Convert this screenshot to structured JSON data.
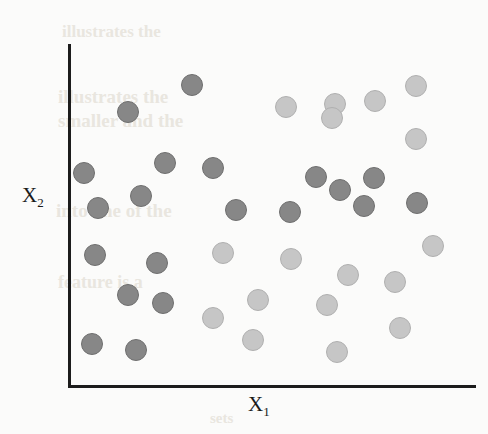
{
  "figure": {
    "width": 488,
    "height": 434,
    "background_color": "#fbfbfa"
  },
  "axes": {
    "x_label": "X",
    "x_label_sub": "1",
    "y_label": "X",
    "y_label_sub": "2",
    "line_color": "#1c1c1c"
  },
  "legend_colors": {
    "class_a": "#878787",
    "class_b": "#c6c6c6"
  },
  "bleed_text": [
    {
      "text": "illustrates the",
      "x": 62,
      "y": 22,
      "size": 17,
      "rotate": 0
    },
    {
      "text": "illustrates the",
      "x": 58,
      "y": 86,
      "size": 19,
      "rotate": 0
    },
    {
      "text": "smaller and the",
      "x": 58,
      "y": 110,
      "size": 19,
      "rotate": 0
    },
    {
      "text": "into one of the",
      "x": 56,
      "y": 200,
      "size": 19,
      "rotate": 0
    },
    {
      "text": "feature is a",
      "x": 58,
      "y": 272,
      "size": 18,
      "rotate": 0
    },
    {
      "text": "sets",
      "x": 210,
      "y": 410,
      "size": 15,
      "rotate": 0
    }
  ],
  "chart_data": {
    "type": "scatter",
    "title": "",
    "xlabel": "X1",
    "ylabel": "X2",
    "xlim": [
      0,
      1
    ],
    "ylim": [
      0,
      1
    ],
    "grid": false,
    "legend_position": "none",
    "point_radius_px": 11,
    "series": [
      {
        "name": "class-a",
        "color": "#878787",
        "marker": "circle",
        "points": [
          {
            "px": 192,
            "py": 85
          },
          {
            "px": 128,
            "py": 112
          },
          {
            "px": 165,
            "py": 163
          },
          {
            "px": 213,
            "py": 168
          },
          {
            "px": 84,
            "py": 173
          },
          {
            "px": 141,
            "py": 196
          },
          {
            "px": 98,
            "py": 208
          },
          {
            "px": 236,
            "py": 210
          },
          {
            "px": 290,
            "py": 212
          },
          {
            "px": 316,
            "py": 177
          },
          {
            "px": 340,
            "py": 190
          },
          {
            "px": 374,
            "py": 178
          },
          {
            "px": 364,
            "py": 206
          },
          {
            "px": 417,
            "py": 203
          },
          {
            "px": 95,
            "py": 255
          },
          {
            "px": 157,
            "py": 263
          },
          {
            "px": 128,
            "py": 295
          },
          {
            "px": 163,
            "py": 303
          },
          {
            "px": 92,
            "py": 344
          },
          {
            "px": 136,
            "py": 350
          }
        ]
      },
      {
        "name": "class-b",
        "color": "#c6c6c6",
        "marker": "circle",
        "points": [
          {
            "px": 335,
            "py": 104
          },
          {
            "px": 286,
            "py": 107
          },
          {
            "px": 332,
            "py": 118
          },
          {
            "px": 375,
            "py": 101
          },
          {
            "px": 416,
            "py": 86
          },
          {
            "px": 416,
            "py": 139
          },
          {
            "px": 433,
            "py": 246
          },
          {
            "px": 223,
            "py": 253
          },
          {
            "px": 291,
            "py": 259
          },
          {
            "px": 348,
            "py": 275
          },
          {
            "px": 395,
            "py": 282
          },
          {
            "px": 258,
            "py": 300
          },
          {
            "px": 327,
            "py": 305
          },
          {
            "px": 213,
            "py": 318
          },
          {
            "px": 400,
            "py": 328
          },
          {
            "px": 253,
            "py": 340
          },
          {
            "px": 337,
            "py": 352
          }
        ]
      }
    ]
  }
}
